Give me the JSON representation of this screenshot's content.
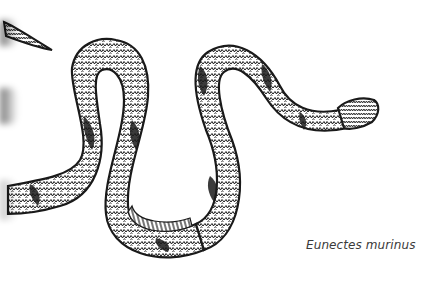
{
  "illustration": {
    "subject": "snake",
    "style": "pen-and-ink scale pattern",
    "colors": {
      "ink": "#1a1a1a",
      "paper": "#ffffff",
      "caption": "#3a3a3a"
    }
  },
  "caption": {
    "text": "Eunectes murinus"
  }
}
